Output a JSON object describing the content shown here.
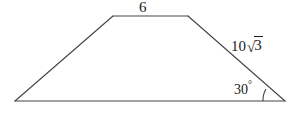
{
  "figure": {
    "type": "geometry-diagram",
    "shape": "trapezoid",
    "background_color": "#ffffff",
    "stroke_color": "#444444",
    "text_color": "#1a1a1a",
    "canvas": {
      "width": 296,
      "height": 115
    },
    "vertices": {
      "bottom_left": {
        "x": 15,
        "y": 101
      },
      "bottom_right": {
        "x": 285,
        "y": 101
      },
      "top_left": {
        "x": 113,
        "y": 16
      },
      "top_right": {
        "x": 188,
        "y": 16
      }
    },
    "labels": {
      "top_side": "6",
      "right_side_coefficient": "10",
      "right_side_surd": "√",
      "right_side_radicand": "3",
      "right_side_full": "10√3",
      "angle": "30",
      "angle_unit": "°",
      "angle_full": "30°"
    },
    "angle_arc": {
      "vertex": "bottom_right",
      "radius": 22,
      "measure_degrees": 30
    }
  }
}
